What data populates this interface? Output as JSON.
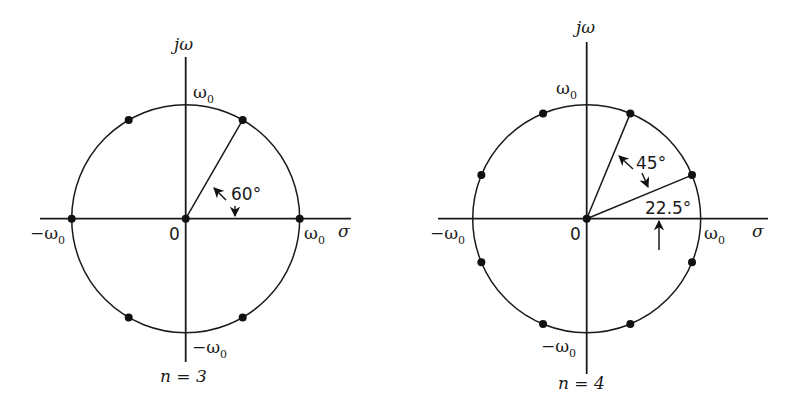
{
  "figure": {
    "panels": [
      {
        "id": "n3",
        "caption": "n = 3",
        "center": [
          185.7,
          218.7
        ],
        "radius": 114,
        "axis_labels": {
          "imag": "jω",
          "real": "σ",
          "origin": "0",
          "top": "ω",
          "top_sub": "0",
          "bottom": "−ω",
          "bottom_sub": "0",
          "left": "−ω",
          "left_sub": "0",
          "right": "ω",
          "right_sub": "0"
        },
        "pole_angles_deg": [
          0,
          60,
          120,
          180,
          240,
          300
        ],
        "origin_pole": true,
        "rays_deg": [
          60
        ],
        "angle_annotations": [
          {
            "label": "60°",
            "from_deg": 0,
            "to_deg": 60
          }
        ]
      },
      {
        "id": "n4",
        "caption": "n = 4",
        "center": [
          586.7,
          218.7
        ],
        "radius": 114,
        "axis_labels": {
          "imag": "jω",
          "real": "σ",
          "origin": "0",
          "top": "ω",
          "top_sub": "0",
          "bottom": "−ω",
          "bottom_sub": "0",
          "left": "−ω",
          "left_sub": "0",
          "right": "ω",
          "right_sub": "0"
        },
        "pole_angles_deg": [
          22.5,
          67.5,
          112.5,
          157.5,
          202.5,
          247.5,
          292.5,
          337.5
        ],
        "origin_pole": true,
        "rays_deg": [
          22.5,
          67.5
        ],
        "angle_annotations": [
          {
            "label": "45°",
            "from_deg": 22.5,
            "to_deg": 67.5
          },
          {
            "label": "22.5°",
            "from_deg": 0,
            "to_deg": 22.5
          }
        ]
      }
    ]
  }
}
